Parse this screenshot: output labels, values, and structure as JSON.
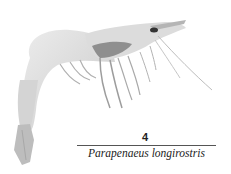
{
  "figure": {
    "number": "4",
    "caption": "Parapenaeus longirostris"
  }
}
